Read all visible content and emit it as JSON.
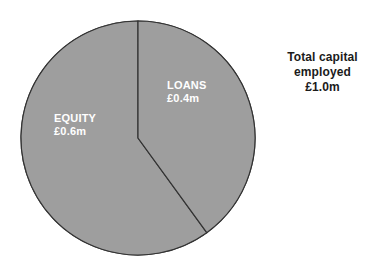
{
  "chart_data": {
    "type": "pie",
    "title": "",
    "subtitle": "",
    "xlabel": "",
    "ylabel": "",
    "categories": [
      "EQUITY",
      "LOANS"
    ],
    "values": [
      0.6,
      0.4
    ],
    "value_labels": [
      "£0.6m",
      "£0.4m"
    ],
    "units": "£m",
    "total": 1.0,
    "total_label": "£1.0m",
    "percentages": [
      60,
      40
    ],
    "legend": "none",
    "legend_position": "inside-slices",
    "grid": false,
    "start_angle_deg": 0,
    "direction": "clockwise",
    "slices": [
      {
        "name": "EQUITY",
        "value": 0.6,
        "value_label": "£0.6m",
        "percent": 60,
        "start_angle_deg": 144,
        "end_angle_deg": 360,
        "fill": "#9e9e9e",
        "stroke": "#333333",
        "label_color": "#ffffff"
      },
      {
        "name": "LOANS",
        "value": 0.4,
        "value_label": "£0.4m",
        "percent": 40,
        "start_angle_deg": 0,
        "end_angle_deg": 144,
        "fill": "#9e9e9e",
        "stroke": "#333333",
        "label_color": "#ffffff"
      }
    ],
    "geometry": {
      "center_x": 138,
      "center_y": 138,
      "radius": 117
    },
    "colors": {
      "background": "#ffffff",
      "slice_fill": "#9e9e9e",
      "slice_stroke": "#333333",
      "slice_label_text": "#ffffff",
      "annotation_text": "#1b1b1b"
    }
  },
  "annotation": {
    "line1": "Total capital",
    "line2": "employed",
    "line3": "£1.0m"
  }
}
